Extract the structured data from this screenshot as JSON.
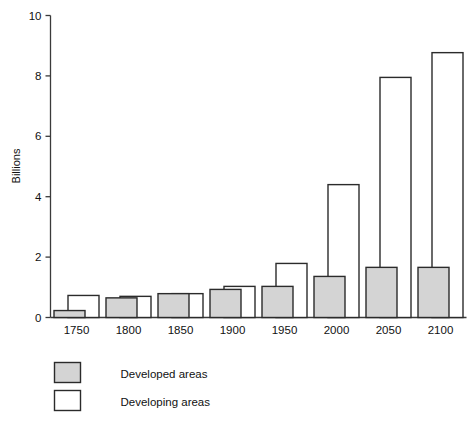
{
  "chart_data": {
    "type": "bar",
    "title": "",
    "xlabel": "",
    "ylabel": "Billions",
    "ylim": [
      0,
      10
    ],
    "yticks": [
      0,
      2,
      4,
      6,
      8,
      10
    ],
    "ytick_labels": [
      "0",
      "2",
      "4",
      "6",
      "8",
      "10"
    ],
    "grid": false,
    "legend_position": "below-left",
    "categories": [
      "1750",
      "1800",
      "1850",
      "1900",
      "1950",
      "2000",
      "2050",
      "2100"
    ],
    "series": [
      {
        "name": "Developed areas",
        "fill": "#d4d4d4",
        "stroke": "#2b2b2b",
        "values": [
          0.23,
          0.65,
          0.79,
          0.93,
          1.03,
          1.36,
          1.66,
          1.66
        ]
      },
      {
        "name": "Developing areas",
        "fill": "#ffffff",
        "stroke": "#2b2b2b",
        "values": [
          0.73,
          0.7,
          0.79,
          1.03,
          1.79,
          4.4,
          7.95,
          8.77
        ]
      }
    ]
  },
  "axes": {
    "y_axis_title": "Billions"
  },
  "legend": {
    "items": [
      {
        "label": "Developed areas",
        "swatch": "gray-swatch"
      },
      {
        "label": "Developing areas",
        "swatch": "white-swatch"
      }
    ]
  },
  "colors": {
    "developed_fill": "#d4d4d4",
    "developing_fill": "#ffffff",
    "outline": "#2b2b2b",
    "axis": "#3a3a3a",
    "text": "#111111",
    "background": "#ffffff"
  }
}
